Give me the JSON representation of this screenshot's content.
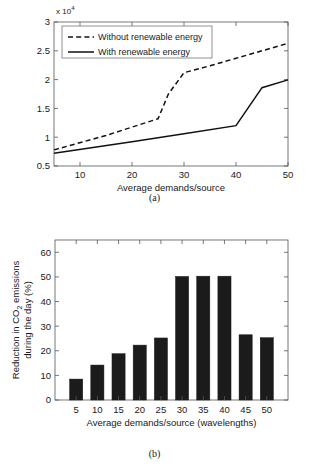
{
  "figure_a": {
    "caption": "(a)",
    "exponent_prefix": "x 10",
    "exponent_power": "4",
    "xlabel": "Average demands/source",
    "xticks": [
      "10",
      "20",
      "30",
      "40",
      "50"
    ],
    "yticks": [
      "0.5",
      "1",
      "1.5",
      "2",
      "2.5",
      "3"
    ],
    "legend": [
      {
        "label": "Without renewable energy",
        "style": "dashed"
      },
      {
        "label": "With renewable energy",
        "style": "solid"
      }
    ]
  },
  "figure_b": {
    "caption": "(b)",
    "ylabel_line1": "Reduction in CO",
    "ylabel_sub": "2",
    "ylabel_line1b": " emissions",
    "ylabel_line2": "during the day (%)",
    "xlabel": "Average demands/source (wavelengths)",
    "xticks": [
      "5",
      "10",
      "15",
      "20",
      "25",
      "30",
      "35",
      "40",
      "45",
      "50"
    ],
    "yticks": [
      "0",
      "10",
      "20",
      "30",
      "40",
      "50",
      "60"
    ]
  },
  "chart_data": [
    {
      "type": "line",
      "id": "figure-a",
      "title": "",
      "xlabel": "Average demands/source",
      "ylabel": "",
      "y_axis_multiplier": 10000,
      "y_axis_multiplier_text": "x 10^4",
      "xlim": [
        5,
        50
      ],
      "ylim": [
        0.5,
        3
      ],
      "ytick_values": [
        0.5,
        1,
        1.5,
        2,
        2.5,
        3
      ],
      "xtick_values": [
        10,
        20,
        30,
        40,
        50
      ],
      "grid": false,
      "legend_position": "top-left",
      "series": [
        {
          "name": "Without renewable energy",
          "style": "dashed",
          "color": "#111111",
          "x": [
            5,
            15,
            25,
            27,
            30,
            35,
            40,
            45,
            50
          ],
          "y": [
            7800,
            10300,
            13200,
            17500,
            21200,
            22400,
            23700,
            25000,
            26300
          ]
        },
        {
          "name": "With renewable energy",
          "style": "solid",
          "color": "#111111",
          "x": [
            5,
            20,
            30,
            40,
            45,
            50
          ],
          "y": [
            7200,
            9200,
            10600,
            12000,
            18600,
            19950
          ]
        }
      ]
    },
    {
      "type": "bar",
      "id": "figure-b",
      "title": "",
      "xlabel": "Average demands/source (wavelengths)",
      "ylabel": "Reduction in CO2 emissions during the day (%)",
      "categories": [
        "5",
        "10",
        "15",
        "20",
        "25",
        "30",
        "35",
        "40",
        "45",
        "50"
      ],
      "values": [
        8.5,
        14.2,
        18.8,
        22.3,
        25.2,
        50.2,
        50.3,
        50.3,
        26.5,
        25.3
      ],
      "ylim": [
        0,
        65
      ],
      "ytick_values": [
        0,
        10,
        20,
        30,
        40,
        50,
        60
      ],
      "grid": false,
      "bar_color": "#1b1b1b"
    }
  ]
}
